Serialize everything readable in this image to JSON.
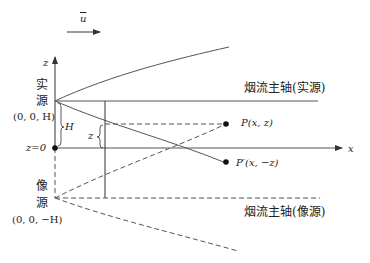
{
  "wind": {
    "label": "u",
    "icon": "wind-arrow"
  },
  "axes": {
    "z_label": "z",
    "x_label": "x",
    "origin_label": "z=0"
  },
  "real_source": {
    "label_line1": "实",
    "label_line2": "源",
    "coord": "(0, 0, H)",
    "height_label": "H"
  },
  "image_source": {
    "label_line1": "像",
    "label_line2": "源",
    "coord": "(0, 0, −H)"
  },
  "plume_axis_real": "烟流主轴(实源)",
  "plume_axis_image": "烟流主轴(像源)",
  "point_p": {
    "label": "P(x, z)"
  },
  "point_p_prime": {
    "label": "P′(x, −z)"
  },
  "z_brace_label": "z"
}
